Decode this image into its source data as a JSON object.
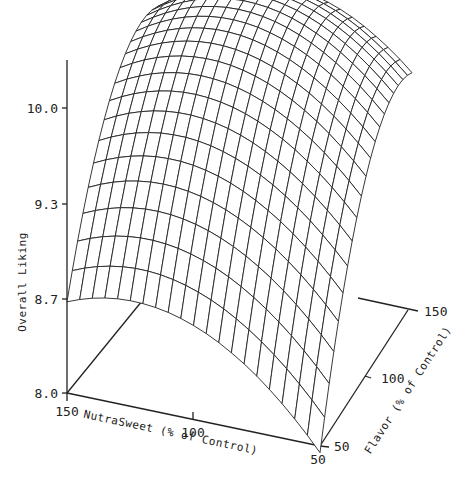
{
  "chart_data": {
    "type": "surface3d",
    "title": "",
    "zlabel": "Overall Liking",
    "xlabel": "NutraSweet (% of Control)",
    "ylabel": "Flavor (% of Control)",
    "z_ticks": [
      "10.0",
      "9.3",
      "8.7",
      "8.0"
    ],
    "x_ticks": [
      "150",
      "100",
      "50"
    ],
    "y_ticks": [
      "50",
      "100",
      "150"
    ],
    "zlim": [
      8.0,
      10.3
    ],
    "xlim": [
      50,
      150
    ],
    "ylim": [
      50,
      150
    ],
    "grid": false,
    "surface_description": "Dome-shaped response surface; maximum Overall Liking (~10.3) near NutraSweet ~110-120% and Flavor ~120-130%; minimum (~8.0) at NutraSweet 50%, Flavor 50%.",
    "sample_points": [
      {
        "nutrasweet": 150,
        "flavor": 50,
        "overall_liking": 9.2
      },
      {
        "nutrasweet": 50,
        "flavor": 50,
        "overall_liking": 8.0
      },
      {
        "nutrasweet": 50,
        "flavor": 150,
        "overall_liking": 9.3
      },
      {
        "nutrasweet": 150,
        "flavor": 150,
        "overall_liking": 9.9
      },
      {
        "nutrasweet": 115,
        "flavor": 125,
        "overall_liking": 10.3
      }
    ]
  },
  "labels": {
    "z_axis_title": "Overall Liking",
    "x_axis_title": "NutraSweet (% of Control)",
    "y_axis_title": "Flavor (% of Control)",
    "z_tick_0": "10.0",
    "z_tick_1": "9.3",
    "z_tick_2": "8.7",
    "z_tick_3": "8.0",
    "x_tick_0": "150",
    "x_tick_1": "100",
    "x_tick_2": "50",
    "y_tick_0": "50",
    "y_tick_1": "100",
    "y_tick_2": "150"
  }
}
